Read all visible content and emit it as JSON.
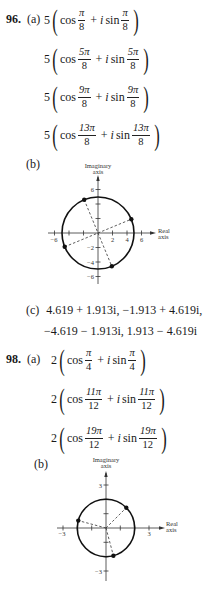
{
  "problems": [
    {
      "number": "96.",
      "part_a_label": "(a)",
      "roots": [
        {
          "coef": "5",
          "num": "π",
          "den": "8"
        },
        {
          "coef": "5",
          "num": "5π",
          "den": "8"
        },
        {
          "coef": "5",
          "num": "9π",
          "den": "8"
        },
        {
          "coef": "5",
          "num": "13π",
          "den": "8"
        }
      ],
      "part_b_label": "(b)",
      "graph": {
        "y_axis_label": [
          "Imaginary",
          "axis"
        ],
        "x_axis_label": [
          "Real",
          "axis"
        ],
        "x_ticks": [
          "−6",
          "2",
          "4",
          "6"
        ],
        "y_ticks": [
          "6",
          "−2",
          "−4",
          "−6"
        ],
        "radius": 5
      },
      "part_c_label": "(c)",
      "part_c_line1": "4.619 + 1.913i, −1.913 + 4.619i,",
      "part_c_line2": "−4.619 − 1.913i, 1.913 − 4.619i"
    },
    {
      "number": "98.",
      "part_a_label": "(a)",
      "roots": [
        {
          "coef": "2",
          "num": "π",
          "den": "4"
        },
        {
          "coef": "2",
          "num": "11π",
          "den": "12"
        },
        {
          "coef": "2",
          "num": "19π",
          "den": "12"
        }
      ],
      "part_b_label": "(b)",
      "graph": {
        "y_axis_label": [
          "Imaginary",
          "axis"
        ],
        "x_axis_label": [
          "Real",
          "axis"
        ],
        "x_ticks": [
          "−3",
          "3"
        ],
        "y_ticks": [
          "3",
          "−3"
        ],
        "radius": 2
      }
    }
  ],
  "text": {
    "cos": "cos",
    "plus": "+",
    "i": "i",
    "sin": "sin"
  }
}
